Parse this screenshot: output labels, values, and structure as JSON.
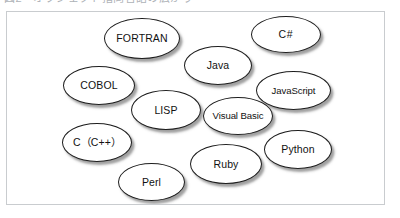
{
  "page": {
    "clipped_caption": "図2　オブジェクト指向言語の広がり",
    "frame_border_color": "#c9cccf",
    "background_color": "#ffffff"
  },
  "diagram": {
    "type": "ellipse-cluster",
    "node_fill_color": "#ffffff",
    "node_border_color": "#1d1d1d",
    "node_shadow_color": "#505050",
    "nodes": [
      {
        "id": "fortran",
        "label": "FORTRAN",
        "x": 104,
        "y": 18,
        "w": 76,
        "h": 41
      },
      {
        "id": "csharp",
        "label": "C#",
        "x": 251,
        "y": 16,
        "w": 70,
        "h": 37
      },
      {
        "id": "java",
        "label": "Java",
        "x": 184,
        "y": 46,
        "w": 68,
        "h": 39
      },
      {
        "id": "cobol",
        "label": "COBOL",
        "x": 63,
        "y": 66,
        "w": 72,
        "h": 39
      },
      {
        "id": "javascript",
        "label": "JavaScript",
        "x": 256,
        "y": 71,
        "w": 75,
        "h": 39
      },
      {
        "id": "lisp",
        "label": "LISP",
        "x": 131,
        "y": 90,
        "w": 70,
        "h": 40
      },
      {
        "id": "visual-basic",
        "label": "Visual Basic",
        "x": 203,
        "y": 97,
        "w": 70,
        "h": 38
      },
      {
        "id": "c-cpp",
        "label": "C（C++）",
        "x": 62,
        "y": 123,
        "w": 70,
        "h": 39
      },
      {
        "id": "python",
        "label": "Python",
        "x": 264,
        "y": 130,
        "w": 68,
        "h": 39
      },
      {
        "id": "ruby",
        "label": "Ruby",
        "x": 190,
        "y": 144,
        "w": 72,
        "h": 40
      },
      {
        "id": "perl",
        "label": "Perl",
        "x": 118,
        "y": 163,
        "w": 67,
        "h": 38
      }
    ]
  }
}
